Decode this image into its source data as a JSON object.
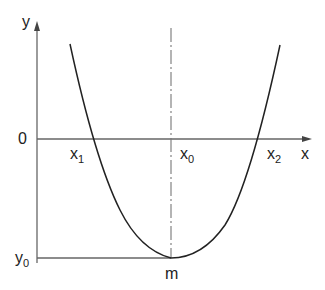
{
  "diagram": {
    "type": "parabola-roots-diagram",
    "axes": {
      "y_label": "y",
      "x_label": "x",
      "origin_label": "0"
    },
    "points": {
      "root1": {
        "base": "x",
        "sub": "1"
      },
      "vertex_x": {
        "base": "x",
        "sub": "0"
      },
      "root2": {
        "base": "x",
        "sub": "2"
      },
      "vertex_y": {
        "base": "y",
        "sub": "0"
      },
      "minimum": "m"
    },
    "colors": {
      "axis": "#666666",
      "curve": "#222222",
      "text": "#222222"
    }
  }
}
